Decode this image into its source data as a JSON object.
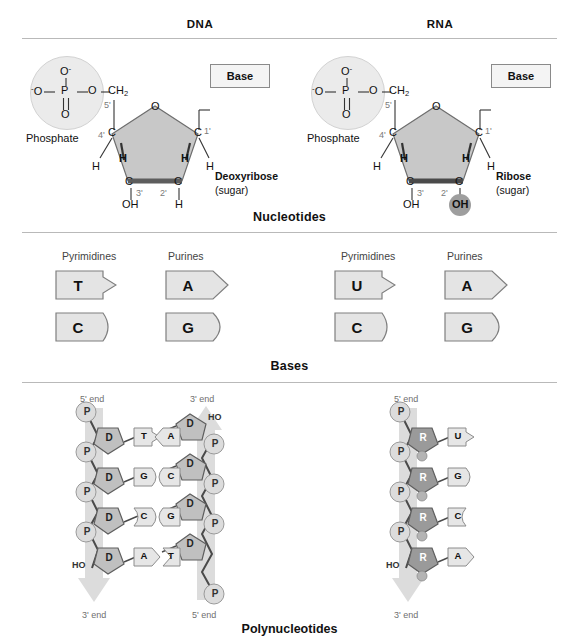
{
  "figure": {
    "columns": [
      {
        "key": "dna",
        "title": "DNA"
      },
      {
        "key": "rna",
        "title": "RNA"
      }
    ],
    "sections": [
      {
        "key": "nucleotides",
        "label": "Nucleotides"
      },
      {
        "key": "bases",
        "label": "Bases"
      },
      {
        "key": "polynucleotides",
        "label": "Polynucleotides"
      }
    ]
  },
  "nucleotide": {
    "dna": {
      "phosphate_label": "Phosphate",
      "phosphate_atoms": {
        "top_oxygen": "O",
        "top_charge": "-",
        "left_oxygen": "O",
        "left_charge": "-",
        "center": "P",
        "right_oxygen": "O",
        "bottom_oxygen": "O"
      },
      "ch2": "CH",
      "ch2_sub": "2",
      "ring_oxygen": "O",
      "base_box_label": "Base",
      "sugar_name": "Deoxyribose",
      "sugar_qualifier": "(sugar)",
      "carbons": [
        {
          "number": "5'",
          "atom": ""
        },
        {
          "number": "4'",
          "atom": "C"
        },
        {
          "number": "3'",
          "atom": "C"
        },
        {
          "number": "2'",
          "atom": "C"
        },
        {
          "number": "1'",
          "atom": "C"
        }
      ],
      "hydrogens": [
        "H",
        "H",
        "H",
        "H"
      ],
      "c3_group": "OH",
      "c2_group": "H",
      "c2_highlighted": false
    },
    "rna": {
      "phosphate_label": "Phosphate",
      "phosphate_atoms": {
        "top_oxygen": "O",
        "top_charge": "-",
        "left_oxygen": "O",
        "left_charge": "-",
        "center": "P",
        "right_oxygen": "O",
        "bottom_oxygen": "O"
      },
      "ch2": "CH",
      "ch2_sub": "2",
      "ring_oxygen": "O",
      "base_box_label": "Base",
      "sugar_name": "Ribose",
      "sugar_qualifier": "(sugar)",
      "carbons": [
        {
          "number": "5'",
          "atom": ""
        },
        {
          "number": "4'",
          "atom": "C"
        },
        {
          "number": "3'",
          "atom": "C"
        },
        {
          "number": "2'",
          "atom": "C"
        },
        {
          "number": "1'",
          "atom": "C"
        }
      ],
      "hydrogens": [
        "H",
        "H",
        "H",
        "H"
      ],
      "c3_group": "OH",
      "c2_group": "OH",
      "c2_highlighted": true
    }
  },
  "bases": {
    "dna": {
      "pyrimidines_label": "Pyrimidines",
      "purines_label": "Purines",
      "pyrimidines": [
        "T",
        "C"
      ],
      "purines": [
        "A",
        "G"
      ]
    },
    "rna": {
      "pyrimidines_label": "Pyrimidines",
      "purines_label": "Purines",
      "pyrimidines": [
        "U",
        "C"
      ],
      "purines": [
        "A",
        "G"
      ]
    }
  },
  "polynucleotides": {
    "dna": {
      "strand_left": {
        "top_end": "5' end",
        "bottom_end": "3' end",
        "terminal_hydroxyl": "HO",
        "sugar_symbol": "D",
        "phosphate_symbol": "P",
        "bases": [
          "T",
          "G",
          "C",
          "A"
        ]
      },
      "strand_right": {
        "top_end": "3' end",
        "bottom_end": "5' end",
        "terminal_hydroxyl": "HO",
        "sugar_symbol": "D",
        "phosphate_symbol": "P",
        "bases": [
          "A",
          "C",
          "G",
          "T"
        ]
      },
      "base_pairs": [
        "T-A",
        "G-C",
        "C-G",
        "A-T"
      ]
    },
    "rna": {
      "strand": {
        "top_end": "5' end",
        "bottom_end": "3' end",
        "terminal_hydroxyl": "HO",
        "sugar_symbol": "R",
        "phosphate_symbol": "P",
        "bases": [
          "U",
          "G",
          "C",
          "A"
        ]
      }
    }
  },
  "colors": {
    "sugar_fill": "#c8c8c8",
    "sugar_stroke": "#6e6e6e",
    "ribose_fill": "#9a9a9a",
    "phosphate_fill": "#ebebeb",
    "base_fill": "#e4e4e4",
    "base_stroke": "#8a8a8a",
    "backbone_band": "#dedede",
    "rule": "#b9b9b9",
    "text": "#1a1a1a",
    "muted_text": "#6f6f6f"
  }
}
